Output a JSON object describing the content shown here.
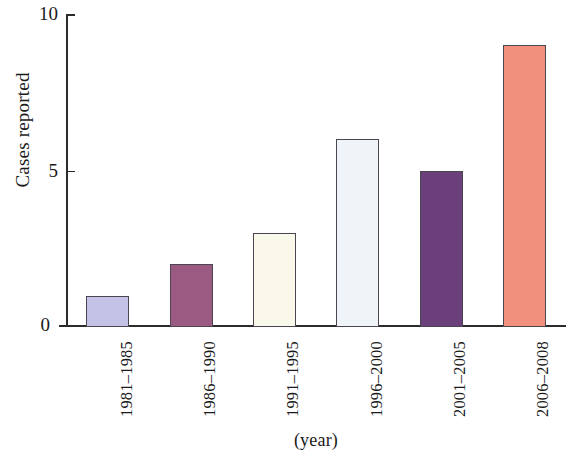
{
  "chart_data": {
    "type": "bar",
    "title": "",
    "subtitle": "",
    "xlabel": "(year)",
    "ylabel": "Cases reported",
    "categories": [
      "1981–1985",
      "1986–1990",
      "1991–1995",
      "1996–2000",
      "2001–2005",
      "2006–2008"
    ],
    "values": [
      1,
      2,
      3,
      6,
      5,
      9
    ],
    "bar_colors": [
      "#c5c2e8",
      "#9b5a82",
      "#faf8e8",
      "#eef4f8",
      "#6b3f7a",
      "#f2907e"
    ],
    "bar_edge_color": "#4a4550",
    "ylim": [
      0,
      10
    ],
    "xlim_note": "categorical",
    "y_ticks": [
      0,
      5,
      10
    ],
    "y_tick_labels": [
      "0",
      "5",
      "10"
    ],
    "grid": false,
    "legend": null,
    "legend_position": "none",
    "background_color": "#ffffff",
    "axis_color": "#2b2b2b"
  },
  "axes": {
    "y_title": "Cases reported",
    "x_title": "(year)",
    "tick_labels": {
      "t0": "0",
      "t5": "5",
      "t10": "10"
    }
  },
  "bars": [
    {
      "label": "1981–1985",
      "value": 1,
      "color": "#c5c2e8"
    },
    {
      "label": "1986–1990",
      "value": 2,
      "color": "#9b5a82"
    },
    {
      "label": "1991–1995",
      "value": 3,
      "color": "#faf8e8"
    },
    {
      "label": "1996–2000",
      "value": 6,
      "color": "#eef4f8"
    },
    {
      "label": "2001–2005",
      "value": 5,
      "color": "#6b3f7a"
    },
    {
      "label": "2006–2008",
      "value": 9,
      "color": "#f2907e"
    }
  ]
}
